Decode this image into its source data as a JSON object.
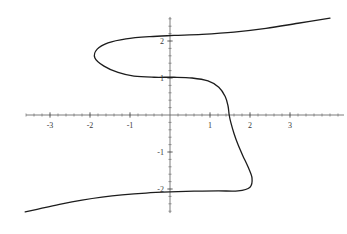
{
  "figure": {
    "title": "",
    "background_color": "#ffffff",
    "width": 347,
    "height": 234
  },
  "axes": {
    "axis_color": "#5a5a5a",
    "curve_color": "#1c1c1c",
    "curve_width": 1.3,
    "origin_px": {
      "x": 170,
      "y": 115
    },
    "scale_px_per_unit": {
      "x": 40.0,
      "y": 37.0
    },
    "x_axis": {
      "label": "",
      "range": [
        -3.6,
        4.35
      ],
      "tick_labels": [
        "-3",
        "-2",
        "-1",
        "1",
        "2",
        "3"
      ],
      "tick_values": [
        -3,
        -2,
        -1,
        1,
        2,
        3
      ],
      "minor_tick_step": 0.2
    },
    "y_axis": {
      "label": "",
      "range": [
        -2.65,
        2.65
      ],
      "tick_labels": [
        "2",
        "1",
        "-1",
        "-2"
      ],
      "tick_values": [
        2,
        1,
        -1,
        -2
      ],
      "minor_tick_step": 0.2
    }
  },
  "chart_data": {
    "type": "line",
    "title": "",
    "xlabel": "",
    "ylabel": "",
    "xlim": [
      -3.6,
      4.35
    ],
    "ylim": [
      -2.65,
      2.65
    ],
    "grid": false,
    "legend": null,
    "relation": "x = y^3 - 3y + 1.48",
    "series": [
      {
        "name": "curve",
        "parameter": "y",
        "points": [
          {
            "x": -3.62,
            "y": -2.62
          },
          {
            "x": -3.2,
            "y": -2.52
          },
          {
            "x": -2.7,
            "y": -2.4
          },
          {
            "x": -2.2,
            "y": -2.3
          },
          {
            "x": -1.7,
            "y": -2.22
          },
          {
            "x": -1.2,
            "y": -2.16
          },
          {
            "x": -0.6,
            "y": -2.11
          },
          {
            "x": 0.0,
            "y": -2.08
          },
          {
            "x": 0.6,
            "y": -2.06
          },
          {
            "x": 1.2,
            "y": -2.05
          },
          {
            "x": 1.7,
            "y": -2.05
          },
          {
            "x": 2.0,
            "y": -1.95
          },
          {
            "x": 2.05,
            "y": -1.7
          },
          {
            "x": 1.95,
            "y": -1.4
          },
          {
            "x": 1.82,
            "y": -1.1
          },
          {
            "x": 1.7,
            "y": -0.8
          },
          {
            "x": 1.6,
            "y": -0.5
          },
          {
            "x": 1.52,
            "y": -0.2
          },
          {
            "x": 1.48,
            "y": 0.0
          },
          {
            "x": 1.45,
            "y": 0.25
          },
          {
            "x": 1.38,
            "y": 0.5
          },
          {
            "x": 1.22,
            "y": 0.75
          },
          {
            "x": 0.95,
            "y": 0.92
          },
          {
            "x": 0.55,
            "y": 1.0
          },
          {
            "x": 0.1,
            "y": 1.02
          },
          {
            "x": -0.4,
            "y": 1.02
          },
          {
            "x": -0.9,
            "y": 1.05
          },
          {
            "x": -1.3,
            "y": 1.15
          },
          {
            "x": -1.65,
            "y": 1.32
          },
          {
            "x": -1.88,
            "y": 1.55
          },
          {
            "x": -1.82,
            "y": 1.78
          },
          {
            "x": -1.55,
            "y": 1.95
          },
          {
            "x": -1.1,
            "y": 2.06
          },
          {
            "x": -0.5,
            "y": 2.12
          },
          {
            "x": 0.1,
            "y": 2.15
          },
          {
            "x": 0.8,
            "y": 2.18
          },
          {
            "x": 1.6,
            "y": 2.24
          },
          {
            "x": 2.4,
            "y": 2.34
          },
          {
            "x": 3.2,
            "y": 2.48
          },
          {
            "x": 4.0,
            "y": 2.62
          }
        ]
      }
    ]
  }
}
